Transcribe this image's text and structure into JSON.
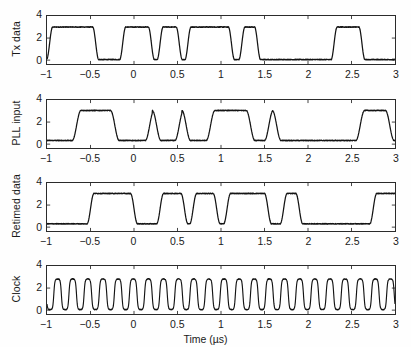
{
  "figure": {
    "background": "#ffffff",
    "line_color": "#141414",
    "axis_color": "#2b2b2b",
    "xlabel": "Time (µs)",
    "xticks": [
      "−1",
      "−0.5",
      "0",
      "0.5",
      "1",
      "1.5",
      "2",
      "2.5",
      "3"
    ],
    "xtick_values": [
      -1,
      -0.5,
      0,
      0.5,
      1,
      1.5,
      2,
      2.5,
      3
    ],
    "yticks": [
      "0",
      "2",
      "4"
    ],
    "ytick_values": [
      0,
      2,
      4
    ],
    "xlim": [
      -1,
      3
    ],
    "ylim": [
      -0.35,
      4
    ]
  },
  "chart_data": [
    {
      "type": "line",
      "title": "",
      "ylabel": "Tx data",
      "xlabel": "",
      "xlim": [
        -1,
        3
      ],
      "ylim": [
        -0.35,
        4
      ],
      "grid": false,
      "legend": "none",
      "series": [
        {
          "name": "Tx data",
          "waveform": "digital",
          "low": 0.05,
          "high": 3.0,
          "noise": 0.07,
          "rise": 0.035,
          "edges": [
            [
              -1.0,
              0
            ],
            [
              -0.97,
              1
            ],
            [
              -0.44,
              0
            ],
            [
              -0.13,
              1
            ],
            [
              0.2,
              0
            ],
            [
              0.3,
              1
            ],
            [
              0.52,
              0
            ],
            [
              0.62,
              1
            ],
            [
              1.12,
              0
            ],
            [
              1.24,
              1
            ],
            [
              1.42,
              0
            ],
            [
              2.3,
              1
            ],
            [
              2.62,
              0
            ],
            [
              3.0,
              0
            ]
          ]
        }
      ]
    },
    {
      "type": "line",
      "title": "",
      "ylabel": "PLL input",
      "xlabel": "",
      "xlim": [
        -1,
        3
      ],
      "ylim": [
        -0.35,
        4
      ],
      "grid": false,
      "legend": "none",
      "series": [
        {
          "name": "PLL input",
          "waveform": "digital",
          "low": 0.33,
          "high": 3.05,
          "noise": 0.07,
          "rise": 0.05,
          "edges": [
            [
              -1.0,
              0
            ],
            [
              -0.66,
              1
            ],
            [
              -0.22,
              0
            ],
            [
              0.18,
              1
            ],
            [
              0.26,
              0
            ],
            [
              0.52,
              1
            ],
            [
              0.6,
              0
            ],
            [
              0.88,
              1
            ],
            [
              1.34,
              0
            ],
            [
              1.55,
              1
            ],
            [
              1.64,
              0
            ],
            [
              2.6,
              1
            ],
            [
              2.94,
              0
            ],
            [
              3.0,
              0
            ]
          ]
        }
      ]
    },
    {
      "type": "line",
      "title": "",
      "ylabel": "Retimed data",
      "xlabel": "",
      "xlim": [
        -1,
        3
      ],
      "ylim": [
        -0.35,
        4
      ],
      "grid": false,
      "legend": "none",
      "series": [
        {
          "name": "Retimed data",
          "waveform": "digital",
          "low": 0.3,
          "high": 3.05,
          "noise": 0.07,
          "rise": 0.04,
          "edges": [
            [
              -1.0,
              0
            ],
            [
              -0.5,
              1
            ],
            [
              0.0,
              0
            ],
            [
              0.3,
              1
            ],
            [
              0.58,
              0
            ],
            [
              0.68,
              1
            ],
            [
              0.95,
              0
            ],
            [
              1.07,
              1
            ],
            [
              1.54,
              0
            ],
            [
              1.72,
              1
            ],
            [
              1.9,
              0
            ],
            [
              2.75,
              1
            ],
            [
              3.0,
              1
            ]
          ]
        }
      ]
    },
    {
      "type": "line",
      "title": "",
      "ylabel": "Clock",
      "xlabel": "Time (µs)",
      "xlim": [
        -1,
        3
      ],
      "ylim": [
        -0.35,
        4
      ],
      "grid": false,
      "legend": "none",
      "series": [
        {
          "name": "Clock",
          "waveform": "clock",
          "low": 0.02,
          "high": 2.85,
          "noise": 0.05,
          "frequency_cycles_per_us": 5.75,
          "phase": 0.55,
          "duty": 0.5
        }
      ]
    }
  ],
  "panels": [
    {
      "ylabel": "Tx data",
      "index": 0
    },
    {
      "ylabel": "PLL input",
      "index": 1
    },
    {
      "ylabel": "Retimed data",
      "index": 2
    },
    {
      "ylabel": "Clock",
      "index": 3
    }
  ]
}
